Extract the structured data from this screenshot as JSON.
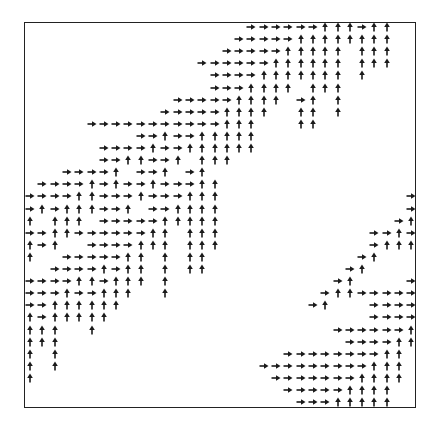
{
  "diagram": {
    "type": "arrow-grid",
    "rows": 32,
    "cols": 32,
    "legend": {
      "R": "right-arrow",
      "U": "up-arrow",
      ".": "empty"
    },
    "arrow_color": "#1a1a1a",
    "frame_color": "#222222",
    "grid": [
      "..................RRRRRRUUURUU..",
      ".................RRRRRUUUUUUUU..",
      "................RRRRRUUUUU.UUU..",
      "..............RRRRRRUUUUUU.UUU..",
      "...............RRRRUUUUUUU.U....",
      "...............RRRUUUU.UUU......",
      "............RRRRRUUUU.RU.U......",
      "...........RRRRRUUUU..UU.U......",
      ".....RRRRRRRRRRRUUU...UU........",
      ".........RRURRUUUUU.............",
      "......RRRRURRUUUUUU.............",
      "......RRUURRU.UUU...............",
      "...RRRRU.RRU.RU.................",
      ".RRRRURURRURRRUU................",
      "RRRRUURRRURRRUUU...............R",
      "RURUUURRU.RRUUUU...............R",
      "U.UUU.RRRRRUUUUU..............RU",
      "RRUURRRRRRUU.UUU............RRUR",
      "URU..RRRRUUU.UUU............RUUU",
      "U..RRRRRUU.U.UU............RU...",
      "..RRRRURUU.U.UU...........RU....",
      "RRRRUURUUU.U.............RU....R",
      "RRRURRUUU..U............RUURRRRR",
      "RRUUUUUU...............RU...RRRR",
      "URUUUUU.....................RRRR",
      "UUU..U...................RRRRRRU",
      "UUU.......................RRRRUU",
      "U.U..................RRRRRRRRUU.",
      "U.U................RRRRRRRRRUUU.",
      "U...................RRRRRRRUUUU.",
      ".....................RRRRRUUUU..",
      "......................RRRUUUUU.."
    ]
  }
}
